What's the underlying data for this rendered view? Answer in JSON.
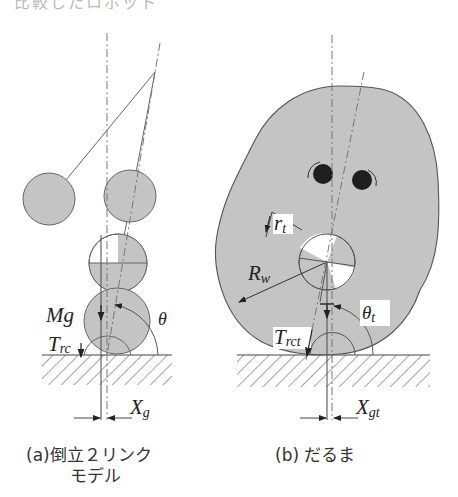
{
  "top_cutoff_text": "比較したロボット",
  "colors": {
    "fill_gray": "#c4c4c4",
    "stroke": "#555555",
    "dark": "#222222",
    "eye": "#1e1e1e"
  },
  "panel_a": {
    "labels": {
      "mg": "Mg",
      "theta": "θ",
      "trc_main": "T",
      "trc_sub": "rc",
      "xg_main": "X",
      "xg_sub": "g"
    },
    "caption_line1": "(a)倒立２リンク",
    "caption_line2": "モデル"
  },
  "panel_b": {
    "labels": {
      "rt_main": "r",
      "rt_sub": "t",
      "rw_main": "R",
      "rw_sub": "w",
      "theta_t_main": "θ",
      "theta_t_sub": "t",
      "trct_main": "T",
      "trct_sub": "rct",
      "xgt_main": "X",
      "xgt_sub": "gt"
    },
    "caption": "(b) だるま"
  }
}
